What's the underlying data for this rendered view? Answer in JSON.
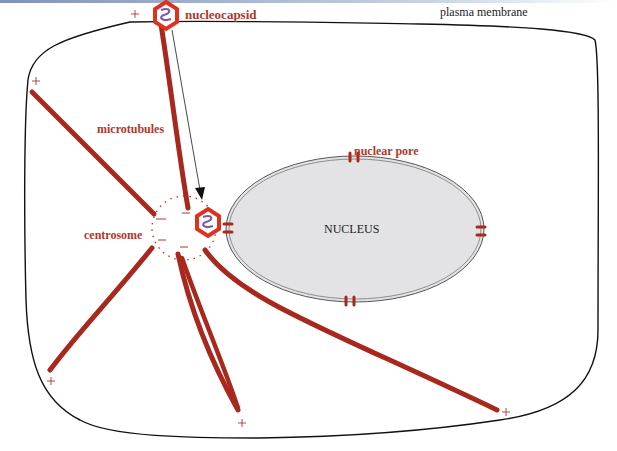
{
  "figure": {
    "type": "cell diagram",
    "colors": {
      "microtubule": "#a8281e",
      "label": "#b0372d",
      "membrane": "#111111",
      "nucleus_fill": "#e3e3e5",
      "capsid_hex": "#e0301e",
      "capsid_genome": "#7b5aa8"
    }
  },
  "labels": {
    "plasma_membrane": "plasma membrane",
    "nucleocapsid": "nucleocapsid",
    "microtubules": "microtubules",
    "nuclear_pore": "nuclear pore",
    "centrosome": "centrosome",
    "nucleus": "NUCLEUS"
  },
  "plus_ends": [
    "+",
    "+",
    "+",
    "+",
    "+"
  ]
}
